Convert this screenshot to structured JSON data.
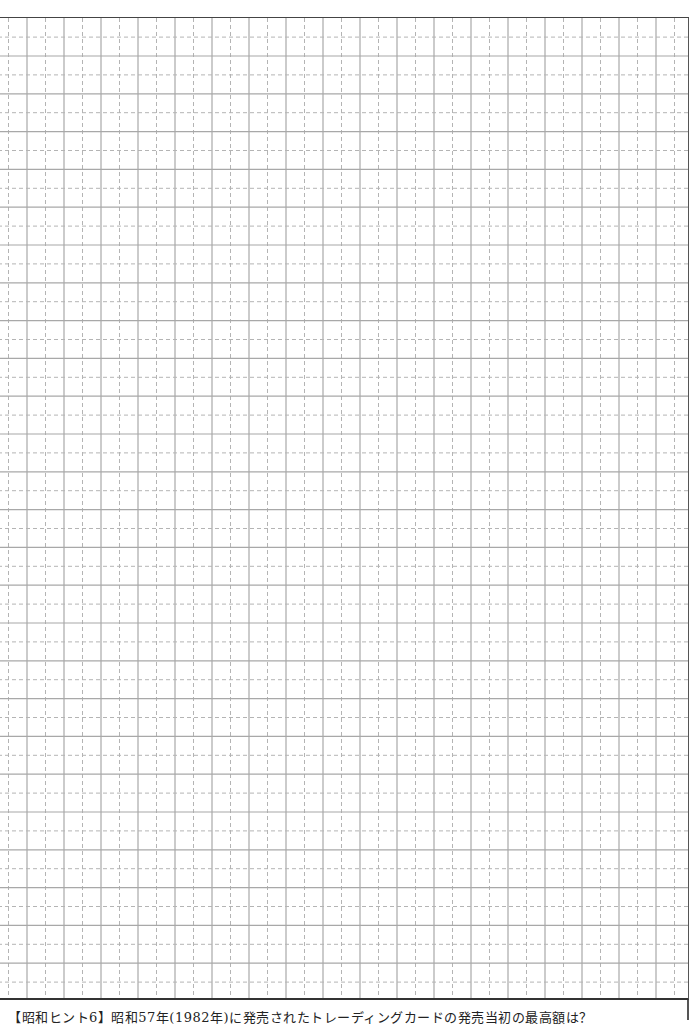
{
  "page": {
    "type": "grid-writing-sheet",
    "grid": {
      "major_line_color": "#a8a8a8",
      "minor_line_color": "#b4b4b4",
      "border_color": "#444444",
      "column_pitch_px": 37,
      "row_pitch_px": 37.8,
      "minor_lines": "dashed",
      "major_lines": "solid"
    },
    "footer": {
      "text": "【昭和ヒント6】昭和57年(1982年)に発売されたトレーディングカードの発売当初の最高額は？"
    }
  }
}
